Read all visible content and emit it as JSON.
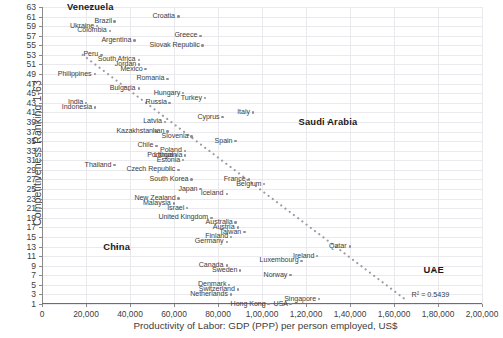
{
  "chart_data": {
    "type": "scatter",
    "title": "",
    "xlabel": "Productivity of Labor: GDP (PPP) per person employed, US$",
    "ylabel": "Competitiveness Ranking 1-63",
    "xlim": [
      0,
      200000
    ],
    "ylim": [
      1,
      63
    ],
    "grid": true,
    "legend": "none",
    "xticklabels": [
      "0",
      "20,000",
      "40,000",
      "60,000",
      "80,000",
      "1,00,000",
      "1,20,000",
      "1,40,000",
      "1,60,000",
      "1,80,000",
      "2,00,000"
    ],
    "xtickvalues": [
      0,
      20000,
      40000,
      60000,
      80000,
      100000,
      120000,
      140000,
      160000,
      180000,
      200000
    ],
    "yticklabels": [
      "1",
      "3",
      "5",
      "7",
      "9",
      "11",
      "13",
      "15",
      "17",
      "19",
      "21",
      "23",
      "25",
      "27",
      "29",
      "31",
      "33",
      "35",
      "37",
      "39",
      "41",
      "43",
      "45",
      "47",
      "49",
      "51",
      "53",
      "55",
      "57",
      "59",
      "61",
      "63"
    ],
    "ytickvalues": [
      1,
      3,
      5,
      7,
      9,
      11,
      13,
      15,
      17,
      19,
      21,
      23,
      25,
      27,
      29,
      31,
      33,
      35,
      37,
      39,
      41,
      43,
      45,
      47,
      49,
      51,
      53,
      55,
      57,
      59,
      61,
      63
    ],
    "annotations": [
      {
        "text": "R² = 0.5439",
        "x": 168000,
        "y": 3
      }
    ],
    "trendline": {
      "type": "linear-dotted",
      "x_start": 18500,
      "y_start": 53,
      "x_end": 165000,
      "y_end": 2,
      "r_squared": 0.5439
    },
    "points": [
      {
        "label": "Venezuela",
        "x": 22000,
        "y": 63,
        "emphasis": "bold"
      },
      {
        "label": "Croatia",
        "x": 62000,
        "y": 61,
        "emphasis": "normal"
      },
      {
        "label": "Brazil",
        "x": 33000,
        "y": 60,
        "emphasis": "normal"
      },
      {
        "label": "Ukraine",
        "x": 25000,
        "y": 59,
        "emphasis": "normal"
      },
      {
        "label": "Colombia",
        "x": 31000,
        "y": 58,
        "emphasis": "normal"
      },
      {
        "label": "Greece",
        "x": 72000,
        "y": 57,
        "emphasis": "normal"
      },
      {
        "label": "Argentina",
        "x": 42000,
        "y": 56,
        "emphasis": "normal"
      },
      {
        "label": "Slovak Republic",
        "x": 73000,
        "y": 55,
        "emphasis": "normal"
      },
      {
        "label": "Peru",
        "x": 27000,
        "y": 53,
        "emphasis": "normal"
      },
      {
        "label": "South Africa",
        "x": 44000,
        "y": 52,
        "emphasis": "normal"
      },
      {
        "label": "Jordan",
        "x": 44000,
        "y": 51,
        "emphasis": "normal"
      },
      {
        "label": "Mexico",
        "x": 47000,
        "y": 50,
        "emphasis": "normal"
      },
      {
        "label": "Philippines",
        "x": 24000,
        "y": 49,
        "emphasis": "normal"
      },
      {
        "label": "Romania",
        "x": 57000,
        "y": 48,
        "emphasis": "normal"
      },
      {
        "label": "Bulgaria",
        "x": 44000,
        "y": 46,
        "emphasis": "normal"
      },
      {
        "label": "Hungary",
        "x": 64000,
        "y": 45,
        "emphasis": "normal"
      },
      {
        "label": "Turkey",
        "x": 74000,
        "y": 44,
        "emphasis": "normal"
      },
      {
        "label": "Russia",
        "x": 58000,
        "y": 43,
        "emphasis": "normal"
      },
      {
        "label": "India",
        "x": 20000,
        "y": 43,
        "emphasis": "normal"
      },
      {
        "label": "Indonesia",
        "x": 24000,
        "y": 42,
        "emphasis": "normal"
      },
      {
        "label": "Italy",
        "x": 96000,
        "y": 41,
        "emphasis": "normal"
      },
      {
        "label": "Cyprus",
        "x": 82000,
        "y": 40,
        "emphasis": "normal"
      },
      {
        "label": "Latvia",
        "x": 56000,
        "y": 39,
        "emphasis": "normal"
      },
      {
        "label": "Kazakhstan",
        "x": 52000,
        "y": 37,
        "emphasis": "normal"
      },
      {
        "label": "Iran",
        "x": 57000,
        "y": 37,
        "emphasis": "normal"
      },
      {
        "label": "Slovenia",
        "x": 68000,
        "y": 36,
        "emphasis": "normal"
      },
      {
        "label": "Spain",
        "x": 88000,
        "y": 35,
        "emphasis": "normal"
      },
      {
        "label": "Chile",
        "x": 52000,
        "y": 34,
        "emphasis": "normal"
      },
      {
        "label": "Poland",
        "x": 65000,
        "y": 33,
        "emphasis": "normal"
      },
      {
        "label": "Portugal",
        "x": 61000,
        "y": 32,
        "emphasis": "normal"
      },
      {
        "label": "Lithuania",
        "x": 65000,
        "y": 32,
        "emphasis": "normal"
      },
      {
        "label": "Estonia",
        "x": 64000,
        "y": 31,
        "emphasis": "normal"
      },
      {
        "label": "Thailand",
        "x": 33000,
        "y": 30,
        "emphasis": "normal"
      },
      {
        "label": "Czech Republic",
        "x": 62000,
        "y": 29,
        "emphasis": "normal"
      },
      {
        "label": "South Korea",
        "x": 68000,
        "y": 27,
        "emphasis": "normal"
      },
      {
        "label": "Japan",
        "x": 72000,
        "y": 25,
        "emphasis": "normal"
      },
      {
        "label": "Iceland",
        "x": 84000,
        "y": 24,
        "emphasis": "normal"
      },
      {
        "label": "New Zealand",
        "x": 62000,
        "y": 23,
        "emphasis": "normal"
      },
      {
        "label": "Malaysia",
        "x": 60000,
        "y": 22,
        "emphasis": "normal"
      },
      {
        "label": "Israel",
        "x": 66000,
        "y": 21,
        "emphasis": "normal"
      },
      {
        "label": "Saudi Arabia",
        "x": 130000,
        "y": 39,
        "emphasis": "bold"
      },
      {
        "label": "France",
        "x": 94000,
        "y": 27,
        "emphasis": "normal"
      },
      {
        "label": "Belgium",
        "x": 101000,
        "y": 26,
        "emphasis": "normal"
      },
      {
        "label": "United Kingdom",
        "x": 77000,
        "y": 19,
        "emphasis": "normal"
      },
      {
        "label": "Australia",
        "x": 88000,
        "y": 18,
        "emphasis": "normal"
      },
      {
        "label": "Austria",
        "x": 89000,
        "y": 17,
        "emphasis": "normal"
      },
      {
        "label": "Taiwan",
        "x": 92000,
        "y": 16,
        "emphasis": "normal"
      },
      {
        "label": "Finland",
        "x": 86000,
        "y": 15,
        "emphasis": "normal"
      },
      {
        "label": "Germany",
        "x": 84000,
        "y": 14,
        "emphasis": "normal"
      },
      {
        "label": "China",
        "x": 34000,
        "y": 13,
        "emphasis": "bold"
      },
      {
        "label": "Qatar",
        "x": 140000,
        "y": 13,
        "emphasis": "normal"
      },
      {
        "label": "Ireland",
        "x": 125000,
        "y": 11,
        "emphasis": "normal"
      },
      {
        "label": "Luxembourg",
        "x": 118000,
        "y": 10,
        "emphasis": "normal"
      },
      {
        "label": "Canada",
        "x": 84000,
        "y": 9,
        "emphasis": "normal"
      },
      {
        "label": "Sweden",
        "x": 90000,
        "y": 8,
        "emphasis": "normal"
      },
      {
        "label": "Norway",
        "x": 113000,
        "y": 7,
        "emphasis": "normal"
      },
      {
        "label": "Denmark",
        "x": 85000,
        "y": 5,
        "emphasis": "normal"
      },
      {
        "label": "Switzerland",
        "x": 89000,
        "y": 4,
        "emphasis": "normal"
      },
      {
        "label": "UAE",
        "x": 178000,
        "y": 8,
        "emphasis": "bold"
      },
      {
        "label": "Netherlands",
        "x": 86000,
        "y": 3,
        "emphasis": "normal"
      },
      {
        "label": "Singapore",
        "x": 126000,
        "y": 2,
        "emphasis": "normal"
      },
      {
        "label": "Hong Kong",
        "x": 103000,
        "y": 1,
        "emphasis": "normal"
      },
      {
        "label": "USA",
        "x": 113000,
        "y": 1,
        "emphasis": "normal"
      }
    ]
  }
}
